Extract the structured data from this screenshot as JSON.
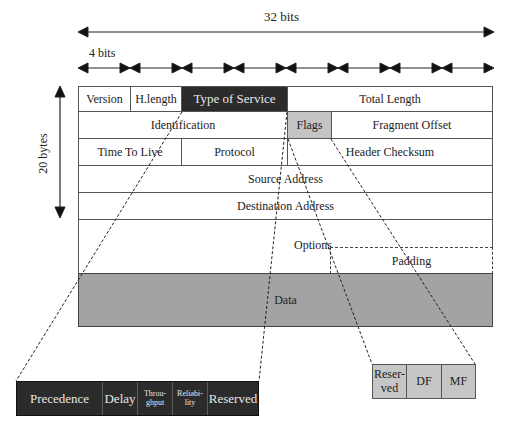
{
  "dimensions": {
    "width_label": "32 bits",
    "nibble_label": "4 bits",
    "height_label": "20 bytes",
    "nibble_segments": 8
  },
  "colors": {
    "type_of_service_fill": "#2b2b2b",
    "flags_fill": "#c4c4c4",
    "data_fill": "#a3a3a3",
    "border": "#555555"
  },
  "header": {
    "row1": {
      "version": "Version",
      "header_length": "H.length",
      "type_of_service": "Type of Service",
      "total_length": "Total Length"
    },
    "row2": {
      "identification": "Identification",
      "flags": "Flags",
      "fragment_offset": "Fragment Offset"
    },
    "row3": {
      "ttl": "Time To Live",
      "protocol": "Protocol",
      "header_checksum": "Header Checksum"
    },
    "row4": {
      "source_address": "Source Address"
    },
    "row5": {
      "destination_address": "Destination Address"
    },
    "row6": {
      "options": "Options",
      "padding": "Padding"
    },
    "data": "Data"
  },
  "type_of_service_breakdown": {
    "precedence": "Precedence",
    "delay": "Delay",
    "throughput_1": "Throu-",
    "throughput_2": "ghput",
    "reliability_1": "Reliabi-",
    "reliability_2": "lity",
    "reserved": "Reserved"
  },
  "flags_breakdown": {
    "reserved_1": "Reser-",
    "reserved_2": "ved",
    "df": "DF",
    "mf": "MF"
  }
}
